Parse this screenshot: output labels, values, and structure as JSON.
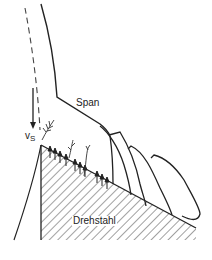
{
  "diagram": {
    "title": "",
    "labels": {
      "chip": "Span",
      "tool": "Drehstahl",
      "velocity_symbol": "v",
      "velocity_subscript": "S"
    },
    "elements": {
      "chip_outline": "Span (chip) flowing up from cutting edge",
      "dashed_line": "original workpiece surface",
      "arrow": "chip velocity vs pointing down",
      "tool_hatched": "tool wedge (hatched)",
      "chip_segments": 4,
      "shear_arrows": "small upward arrows along rake face"
    },
    "colors": {
      "line": "#222222",
      "hatch": "#444444",
      "background": "#ffffff"
    }
  }
}
